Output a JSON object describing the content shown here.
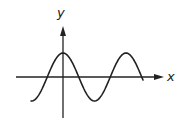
{
  "diagram": {
    "type": "function-graph",
    "x_axis_label": "x",
    "y_axis_label": "y",
    "colors": {
      "stroke": "#222222",
      "background": "#ffffff"
    }
  },
  "chart_data": {
    "type": "line",
    "title": "",
    "xlabel": "x",
    "ylabel": "y",
    "grid": false,
    "legend": "none",
    "function_shape": "y = cos(x)",
    "series": [
      {
        "name": "curve",
        "x": [
          -1.0,
          -0.75,
          -0.5,
          -0.25,
          0,
          0.25,
          0.5,
          0.75,
          1.0,
          1.25,
          1.5,
          1.75
        ],
        "values": [
          -1.0,
          -0.0,
          0.0,
          0.0,
          1.0,
          0.0,
          -1.0,
          0.0,
          1.0,
          0.0,
          -1.0,
          0.0
        ],
        "note": "x in periods relative to y-axis; curve starts at trough left of origin, peaks at x=0, trough at x=0.5, peak at x=1, ends on axis near x=1.27"
      }
    ],
    "key_points": [
      {
        "label": "start",
        "x_period": -0.5,
        "y": -1
      },
      {
        "label": "peak",
        "x_period": 0,
        "y": 1
      },
      {
        "label": "trough",
        "x_period": 0.5,
        "y": -1
      },
      {
        "label": "peak",
        "x_period": 1,
        "y": 1
      },
      {
        "label": "end",
        "x_period": 1.27,
        "y": 0
      }
    ]
  }
}
